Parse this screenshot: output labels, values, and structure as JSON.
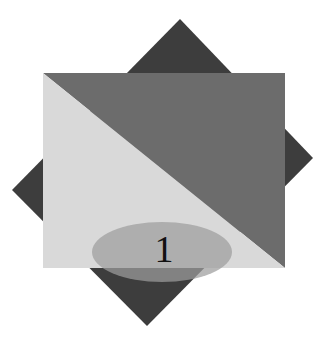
{
  "figure": {
    "background_color": "#ffffff",
    "width": 334,
    "height": 342,
    "label": "1",
    "label_color": "#111111",
    "shapes": [
      {
        "name": "diamond",
        "kind": "rotated-square",
        "color": "#3d3d3d",
        "points": "180,19 313,158 147,326 12,190"
      },
      {
        "name": "upper-right-triangle",
        "kind": "triangle",
        "color": "#6c6c6c",
        "points": "43,73 285,73 285,268"
      },
      {
        "name": "lower-left-triangle",
        "kind": "triangle",
        "color": "#d9d9d9",
        "points": "43,73 285,268 43,268"
      },
      {
        "name": "ellipse",
        "kind": "ellipse",
        "color": "#9d9d9d",
        "opacity": "0.72",
        "cx": 162,
        "cy": 252,
        "rx": 70,
        "ry": 30
      }
    ]
  }
}
